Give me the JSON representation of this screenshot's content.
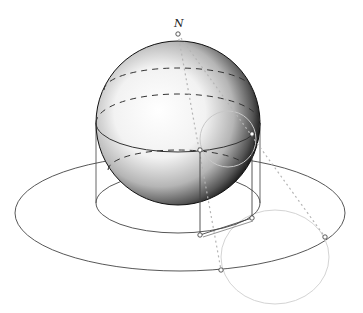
{
  "diagram": {
    "labels": {
      "north_pole": "N"
    },
    "colors": {
      "background": "#ffffff",
      "stroke": "#3a3a3a",
      "dashed": "#444444",
      "dotted_projection": "#b8b8b8",
      "light_circle": "#cfcfcf",
      "sphere_light": "#ffffff",
      "sphere_dark": "#1a1a1a",
      "point_fill": "#ffffff"
    },
    "sphere": {
      "cx": 178,
      "cy": 123,
      "r": 82
    },
    "plane_ellipse": {
      "cx": 180,
      "cy": 213,
      "rx": 165,
      "ry": 58
    },
    "cylinder_base": {
      "cx": 178,
      "cy": 203,
      "rx": 82,
      "ry": 30
    },
    "equator": {
      "cx": 178,
      "cy": 123,
      "rx": 82,
      "ry": 29
    },
    "latitude_upper": {
      "cx": 178,
      "cy": 90,
      "rx": 74,
      "ry": 22
    },
    "latitude_lower": {
      "cx": 178,
      "cy": 170,
      "rx": 70,
      "ry": 20
    },
    "small_circle_on_sphere": {
      "cx": 228,
      "cy": 139,
      "r": 28
    },
    "projected_circle": {
      "cx": 275,
      "cy": 257,
      "rx": 54,
      "ry": 47
    },
    "points": [
      {
        "name": "north-pole-point",
        "x": 178,
        "y": 34
      },
      {
        "name": "sphere-point-a",
        "x": 252,
        "y": 134
      },
      {
        "name": "sphere-point-b",
        "x": 200,
        "y": 150
      },
      {
        "name": "base-point-a",
        "x": 252,
        "y": 218
      },
      {
        "name": "base-point-b",
        "x": 200,
        "y": 235
      },
      {
        "name": "projected-point-a",
        "x": 325,
        "y": 237
      },
      {
        "name": "projected-point-b",
        "x": 221,
        "y": 270
      }
    ]
  }
}
